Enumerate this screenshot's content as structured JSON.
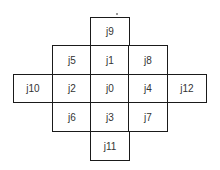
{
  "diagram": {
    "type": "grid-neighborhood",
    "center": "j0",
    "cells": [
      {
        "label": "j9",
        "col": 2,
        "row": 0
      },
      {
        "label": "j5",
        "col": 1,
        "row": 1
      },
      {
        "label": "j1",
        "col": 2,
        "row": 1
      },
      {
        "label": "j8",
        "col": 3,
        "row": 1
      },
      {
        "label": "j10",
        "col": 0,
        "row": 2
      },
      {
        "label": "j2",
        "col": 1,
        "row": 2
      },
      {
        "label": "j0",
        "col": 2,
        "row": 2
      },
      {
        "label": "j4",
        "col": 3,
        "row": 2
      },
      {
        "label": "j12",
        "col": 4,
        "row": 2
      },
      {
        "label": "j6",
        "col": 1,
        "row": 3
      },
      {
        "label": "j3",
        "col": 2,
        "row": 3
      },
      {
        "label": "j7",
        "col": 3,
        "row": 3
      },
      {
        "label": "j11",
        "col": 2,
        "row": 4
      }
    ]
  }
}
